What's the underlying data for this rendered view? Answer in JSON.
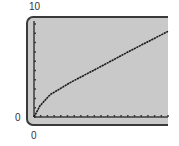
{
  "chart_data": {
    "type": "line",
    "title": "",
    "xlabel": "",
    "ylabel": "",
    "xlim": [
      0,
      20
    ],
    "ylim": [
      0,
      10
    ],
    "x_tick_labels": [
      "0"
    ],
    "y_tick_labels": [
      "0",
      "10"
    ],
    "x_tick_step": 1,
    "y_tick_step": 1,
    "grid": false,
    "series": [
      {
        "name": "curve",
        "x": [
          0,
          0.9,
          2.4,
          5.4,
          9.9,
          14.3,
          20
        ],
        "y": [
          0,
          1.2,
          2.4,
          3.7,
          5.4,
          7.1,
          9.2
        ]
      }
    ]
  },
  "labels": {
    "y_max": "10",
    "y_min": "0",
    "x_min": "0"
  },
  "colors": {
    "screen": "#c9c9c9",
    "frame": "#3a3a3a",
    "curve": "#1a1a1a"
  }
}
